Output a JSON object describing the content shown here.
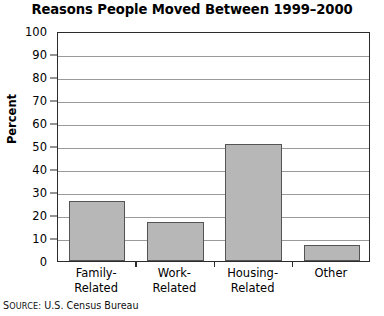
{
  "chart_data": {
    "type": "bar",
    "title": "Reasons People Moved Between 1999–2000",
    "xlabel": "",
    "ylabel": "Percent",
    "categories": [
      "Family-Related",
      "Work-Related",
      "Housing-Related",
      "Other"
    ],
    "category_lines": [
      [
        "Family-",
        "Related"
      ],
      [
        "Work-",
        "Related"
      ],
      [
        "Housing-",
        "Related"
      ],
      [
        "Other",
        ""
      ]
    ],
    "values": [
      26,
      17,
      51,
      7
    ],
    "ylim": [
      0,
      100
    ],
    "ytick_values": [
      0,
      10,
      20,
      30,
      40,
      50,
      60,
      70,
      80,
      90,
      100
    ],
    "ytick_labels": [
      "0",
      "10",
      "20",
      "30",
      "40",
      "50",
      "60",
      "70",
      "80",
      "90",
      "100"
    ],
    "grid": true,
    "legend": false,
    "bar_fill_color": "#b7b7b7",
    "bar_border_color": "#545454",
    "gridline_color": "#9a9a9a",
    "axis_color": "#2b2b2b"
  },
  "source_note": {
    "label": "Source:",
    "label_first_letter": "S",
    "label_rest": "OURCE:",
    "text": "U.S. Census Bureau",
    "full": "Source: U.S. Census Bureau"
  }
}
